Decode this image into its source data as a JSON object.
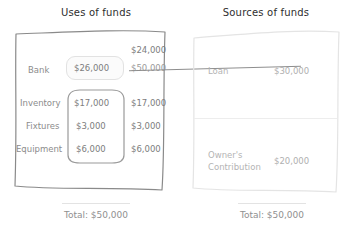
{
  "diagram": {
    "uses": {
      "title": "Uses of funds",
      "rows": [
        {
          "label": "Bank",
          "value_boxed": "$26,000",
          "value_new": "$24,000",
          "value_old": "$50,000"
        },
        {
          "label": "Inventory",
          "value_boxed": "$17,000",
          "value_plain": "$17,000"
        },
        {
          "label": "Fixtures",
          "value_boxed": "$3,000",
          "value_plain": "$3,000"
        },
        {
          "label": "Equipment",
          "value_boxed": "$6,000",
          "value_plain": "$6,000"
        }
      ],
      "total_label": "Total: $50,000"
    },
    "sources": {
      "title": "Sources of funds",
      "rows": [
        {
          "label": "Loan",
          "value": "$30,000"
        },
        {
          "label": "Owner's\nContribution",
          "label_line1": "Owner's",
          "label_line2": "Contribution",
          "value": "$20,000"
        }
      ],
      "total_label": "Total: $50,000"
    },
    "colors": {
      "panel_stroke_strong": "#8a8a8a",
      "panel_stroke_faint": "#e8e8e8",
      "text_primary": "#2e2e2e",
      "text_muted": "#8c8c8c",
      "highlight_border": "#e2e2e2",
      "background": "#ffffff"
    }
  }
}
